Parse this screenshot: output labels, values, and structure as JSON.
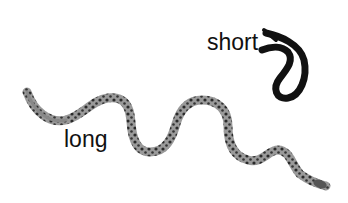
{
  "labels": {
    "short": "short",
    "long": "long"
  },
  "colors": {
    "short_snake": "#111111",
    "long_snake_body": "#8a8a8a",
    "long_snake_spots": "#2a2a2a",
    "text": "#111111"
  }
}
